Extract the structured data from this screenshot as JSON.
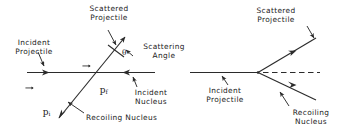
{
  "figure": {
    "stroke_color": "#2b2b2b",
    "text_color": "#1a1a1a",
    "background": "#ffffff"
  },
  "left_diagram": {
    "labels": {
      "incident_projectile": "Incident\nProjectile",
      "scattered_projectile": "Scattered\nProjectile",
      "scattering_angle": "Scattering\nAngle",
      "incident_nucleus": "Incident\nNucleus",
      "recoiling_nucleus": "Recoiling Nucleus"
    },
    "vectors": {
      "p_initial": "p",
      "p_initial_sub": "i",
      "p_final": "p",
      "p_final_sub": "f"
    },
    "angle_symbol": "θ"
  },
  "right_diagram": {
    "labels": {
      "scattered_projectile": "Scattered\nProjectile",
      "incident_projectile": "Incident\nProjectile",
      "recoiling_nucleus": "Recoiling\nNucleus"
    }
  }
}
